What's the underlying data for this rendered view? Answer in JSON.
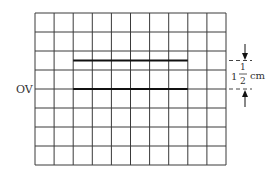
{
  "diagram": {
    "type": "oscilloscope-screen",
    "grid": {
      "columns": 10,
      "rows": 8,
      "line_color": "#3a3a3a"
    },
    "zero_line_label": "OV",
    "traces": [
      {
        "name": "upper-trace",
        "start_col": 2,
        "end_col": 8,
        "offset_divisions": 1.5
      },
      {
        "name": "zero-trace",
        "start_col": 2,
        "end_col": 8,
        "offset_divisions": 0
      }
    ],
    "annotation": {
      "whole": "1",
      "numerator": "1",
      "denominator": "2",
      "unit": "cm"
    }
  }
}
